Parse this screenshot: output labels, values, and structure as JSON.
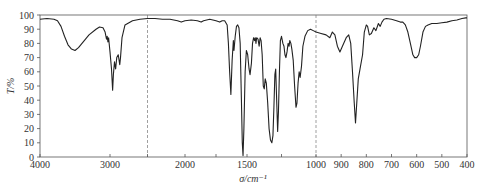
{
  "chart_data": {
    "type": "line",
    "title": "",
    "xlabel": "σ/cm⁻¹",
    "ylabel": "T/%",
    "xlim": [
      4000,
      400
    ],
    "ylim": [
      0,
      100
    ],
    "x_reversed": true,
    "grid": false,
    "legend": null,
    "x_ticks": [
      4000,
      3000,
      2000,
      1500,
      1000,
      900,
      800,
      700,
      600,
      500,
      400
    ],
    "x_minor_ticks": [
      2500,
      1750,
      1250
    ],
    "y_ticks": [
      0,
      10,
      20,
      30,
      40,
      50,
      60,
      70,
      80,
      90,
      100
    ],
    "dashed_vlines": [
      2500,
      1000
    ],
    "series": [
      {
        "name": "IR spectrum",
        "color": "#222222",
        "points": [
          [
            4000,
            97
          ],
          [
            3900,
            97.5
          ],
          [
            3800,
            97
          ],
          [
            3750,
            96
          ],
          [
            3700,
            92
          ],
          [
            3650,
            85
          ],
          [
            3600,
            79
          ],
          [
            3550,
            76
          ],
          [
            3500,
            75
          ],
          [
            3450,
            77
          ],
          [
            3400,
            80
          ],
          [
            3300,
            86
          ],
          [
            3200,
            90
          ],
          [
            3150,
            91.5
          ],
          [
            3100,
            91
          ],
          [
            3070,
            88
          ],
          [
            3050,
            83
          ],
          [
            3040,
            85
          ],
          [
            3030,
            81
          ],
          [
            3020,
            84
          ],
          [
            3000,
            74
          ],
          [
            2980,
            62
          ],
          [
            2965,
            47
          ],
          [
            2955,
            58
          ],
          [
            2940,
            67
          ],
          [
            2925,
            62
          ],
          [
            2910,
            70
          ],
          [
            2890,
            72
          ],
          [
            2870,
            65
          ],
          [
            2860,
            70
          ],
          [
            2840,
            84
          ],
          [
            2800,
            93
          ],
          [
            2700,
            96
          ],
          [
            2600,
            97
          ],
          [
            2500,
            97.5
          ],
          [
            2400,
            97.5
          ],
          [
            2300,
            97
          ],
          [
            2200,
            97
          ],
          [
            2100,
            96
          ],
          [
            2050,
            95
          ],
          [
            2000,
            96
          ],
          [
            1950,
            96.5
          ],
          [
            1900,
            96
          ],
          [
            1870,
            95
          ],
          [
            1850,
            96
          ],
          [
            1800,
            97
          ],
          [
            1750,
            96
          ],
          [
            1720,
            95
          ],
          [
            1700,
            96
          ],
          [
            1680,
            96
          ],
          [
            1660,
            93
          ],
          [
            1650,
            80
          ],
          [
            1640,
            60
          ],
          [
            1630,
            44
          ],
          [
            1620,
            68
          ],
          [
            1610,
            82
          ],
          [
            1605,
            75
          ],
          [
            1595,
            85
          ],
          [
            1585,
            92
          ],
          [
            1575,
            93
          ],
          [
            1565,
            91
          ],
          [
            1555,
            80
          ],
          [
            1545,
            40
          ],
          [
            1538,
            10
          ],
          [
            1532,
            1
          ],
          [
            1525,
            20
          ],
          [
            1515,
            60
          ],
          [
            1505,
            75
          ],
          [
            1495,
            72
          ],
          [
            1485,
            62
          ],
          [
            1478,
            58
          ],
          [
            1468,
            66
          ],
          [
            1460,
            80
          ],
          [
            1452,
            84
          ],
          [
            1445,
            82
          ],
          [
            1440,
            84
          ],
          [
            1435,
            80
          ],
          [
            1430,
            84
          ],
          [
            1420,
            83
          ],
          [
            1412,
            78
          ],
          [
            1405,
            84
          ],
          [
            1398,
            82
          ],
          [
            1390,
            72
          ],
          [
            1382,
            50
          ],
          [
            1375,
            48
          ],
          [
            1368,
            55
          ],
          [
            1360,
            52
          ],
          [
            1350,
            38
          ],
          [
            1340,
            20
          ],
          [
            1330,
            12
          ],
          [
            1320,
            10
          ],
          [
            1312,
            15
          ],
          [
            1305,
            35
          ],
          [
            1298,
            58
          ],
          [
            1292,
            62
          ],
          [
            1285,
            40
          ],
          [
            1278,
            18
          ],
          [
            1272,
            32
          ],
          [
            1265,
            60
          ],
          [
            1258,
            82
          ],
          [
            1250,
            85
          ],
          [
            1240,
            80
          ],
          [
            1232,
            78
          ],
          [
            1225,
            72
          ],
          [
            1218,
            70
          ],
          [
            1210,
            74
          ],
          [
            1202,
            80
          ],
          [
            1195,
            78
          ],
          [
            1190,
            82
          ],
          [
            1182,
            80
          ],
          [
            1175,
            76
          ],
          [
            1165,
            68
          ],
          [
            1155,
            50
          ],
          [
            1145,
            35
          ],
          [
            1138,
            38
          ],
          [
            1130,
            52
          ],
          [
            1122,
            60
          ],
          [
            1115,
            56
          ],
          [
            1105,
            64
          ],
          [
            1095,
            78
          ],
          [
            1080,
            85
          ],
          [
            1060,
            89
          ],
          [
            1040,
            90
          ],
          [
            1020,
            89
          ],
          [
            1000,
            88
          ],
          [
            980,
            87
          ],
          [
            960,
            86
          ],
          [
            945,
            84
          ],
          [
            935,
            88
          ],
          [
            925,
            86
          ],
          [
            915,
            78
          ],
          [
            905,
            74
          ],
          [
            895,
            78
          ],
          [
            880,
            84
          ],
          [
            870,
            86
          ],
          [
            862,
            80
          ],
          [
            855,
            60
          ],
          [
            848,
            38
          ],
          [
            843,
            24
          ],
          [
            838,
            38
          ],
          [
            832,
            55
          ],
          [
            825,
            62
          ],
          [
            815,
            72
          ],
          [
            808,
            88
          ],
          [
            800,
            93
          ],
          [
            795,
            92
          ],
          [
            788,
            86
          ],
          [
            780,
            87
          ],
          [
            770,
            91
          ],
          [
            762,
            89
          ],
          [
            752,
            94
          ],
          [
            745,
            92
          ],
          [
            738,
            95
          ],
          [
            730,
            97
          ],
          [
            720,
            97.5
          ],
          [
            700,
            97
          ],
          [
            680,
            96
          ],
          [
            665,
            95
          ],
          [
            655,
            95
          ],
          [
            645,
            93
          ],
          [
            635,
            88
          ],
          [
            625,
            80
          ],
          [
            615,
            72
          ],
          [
            608,
            70
          ],
          [
            600,
            70
          ],
          [
            592,
            72
          ],
          [
            585,
            78
          ],
          [
            575,
            88
          ],
          [
            565,
            92
          ],
          [
            555,
            93
          ],
          [
            540,
            94
          ],
          [
            520,
            94
          ],
          [
            500,
            94.5
          ],
          [
            480,
            95
          ],
          [
            460,
            96
          ],
          [
            440,
            96.5
          ],
          [
            420,
            97.5
          ],
          [
            405,
            98
          ],
          [
            400,
            98
          ]
        ]
      }
    ]
  }
}
